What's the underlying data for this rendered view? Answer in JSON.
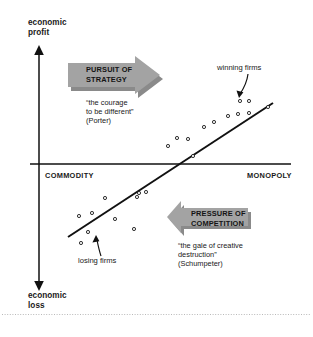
{
  "figure": {
    "title": "",
    "axes": {
      "y_top_label": "economic\nprofit",
      "y_bottom_label": "economic\nloss",
      "x_left_label": "COMMODITY",
      "x_right_label": "MONOPOLY"
    },
    "annotations": {
      "winning_firms": "winning firms",
      "losing_firms": "losing firms"
    },
    "callouts": [
      {
        "id": "pursuit-of-strategy",
        "banner": "PURSUIT OF\nSTRATEGY",
        "direction": "right",
        "quote": "“the courage\nto be different”\n(Porter)",
        "attribution": "(Porter)",
        "color": "#a3a3a3"
      },
      {
        "id": "pressure-of-competition",
        "banner": "PRESSURE OF\nCOMPETITION",
        "direction": "left",
        "quote": "“the gale of creative\ndestruction”\n(Schumpeter)",
        "attribution": "(Schumpeter)",
        "color": "#a3a3a3"
      }
    ],
    "colors": {
      "axis": "#111111",
      "trendline": "#111111",
      "marker_stroke": "#111111",
      "arrow_fill": "#a3a3a3",
      "arrow_shadow": "#8a8a8a",
      "footer_rule": "#b9b9b9"
    }
  },
  "chart_data": {
    "type": "scatter",
    "title": "",
    "xlabel": "COMMODITY → MONOPOLY",
    "ylabel": "economic loss → economic profit",
    "grid": false,
    "legend": "none",
    "axis_origin_px": {
      "x": 39,
      "y": 164
    },
    "x_axis_px": {
      "from": 30,
      "to": 291,
      "y": 164
    },
    "y_axis_px": {
      "x": 39,
      "from": 48,
      "to": 288
    },
    "xlim": [
      0,
      100
    ],
    "ylim": [
      -100,
      100
    ],
    "series": [
      {
        "name": "firms",
        "points_px": [
          [
            81,
            243
          ],
          [
            79,
            216
          ],
          [
            88,
            232
          ],
          [
            92,
            213
          ],
          [
            105,
            198
          ],
          [
            115,
            219
          ],
          [
            134,
            229
          ],
          [
            137,
            197
          ],
          [
            139,
            193
          ],
          [
            146,
            192
          ],
          [
            168,
            146
          ],
          [
            177,
            138
          ],
          [
            188,
            139
          ],
          [
            193,
            156
          ],
          [
            204,
            127
          ],
          [
            214,
            122
          ],
          [
            228,
            116
          ],
          [
            238,
            114
          ],
          [
            240,
            101
          ],
          [
            249,
            101
          ],
          [
            249,
            113
          ],
          [
            268,
            107
          ]
        ]
      }
    ],
    "trendline_px": {
      "x1": 68,
      "y1": 237,
      "x2": 273,
      "y2": 103
    },
    "marker": "open-circle"
  }
}
